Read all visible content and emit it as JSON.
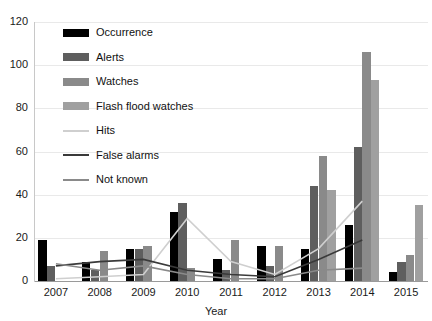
{
  "chart_data": {
    "type": "bar",
    "title": "",
    "xlabel": "Year",
    "ylabel": "",
    "categories": [
      "2007",
      "2008",
      "2009",
      "2010",
      "2011",
      "2012",
      "2013",
      "2014",
      "2015"
    ],
    "ylim": [
      0,
      120
    ],
    "ytick_values": [
      0,
      20,
      40,
      60,
      80,
      100,
      120
    ],
    "ytick_labels": [
      "0",
      "20",
      "40",
      "60",
      "80",
      "100",
      "120"
    ],
    "grid": true,
    "legend_position": "upper-left-inside",
    "series": [
      {
        "name": "Occurrence",
        "kind": "bar",
        "color": "#000000",
        "values": [
          19,
          9,
          15,
          32,
          10,
          16,
          15,
          26,
          4
        ]
      },
      {
        "name": "Alerts",
        "kind": "bar",
        "color": "#5e5e5e",
        "values": [
          7,
          5,
          15,
          36,
          5,
          7,
          44,
          62,
          9
        ]
      },
      {
        "name": "Watches",
        "kind": "bar",
        "color": "#8a8a8a",
        "values": [
          0,
          14,
          16,
          6,
          19,
          16,
          58,
          106,
          12
        ]
      },
      {
        "name": "Flash flood watches",
        "kind": "bar",
        "color": "#a0a0a0",
        "values": [
          0,
          0,
          0,
          0,
          0,
          0,
          42,
          93,
          35
        ]
      },
      {
        "name": "Hits",
        "kind": "line",
        "color": "#cfcfcf",
        "values": [
          1,
          2,
          3,
          29,
          9,
          3,
          15,
          37,
          null
        ]
      },
      {
        "name": "False alarms",
        "kind": "line",
        "color": "#3a3a3a",
        "values": [
          7,
          9,
          10,
          5,
          3,
          2,
          10,
          19,
          null
        ]
      },
      {
        "name": "Not known",
        "kind": "line",
        "color": "#8a8a8a",
        "values": [
          8,
          5,
          7,
          3,
          1,
          1,
          5,
          6,
          null
        ]
      }
    ]
  },
  "legend": {
    "items": [
      {
        "label": "Occurrence",
        "color": "#000000",
        "kind": "bar"
      },
      {
        "label": "Alerts",
        "color": "#5e5e5e",
        "kind": "bar"
      },
      {
        "label": "Watches",
        "color": "#8a8a8a",
        "kind": "bar"
      },
      {
        "label": "Flash flood watches",
        "color": "#a0a0a0",
        "kind": "bar"
      },
      {
        "label": "Hits",
        "color": "#cfcfcf",
        "kind": "line"
      },
      {
        "label": "False alarms",
        "color": "#3a3a3a",
        "kind": "line"
      },
      {
        "label": "Not known",
        "color": "#8a8a8a",
        "kind": "line"
      }
    ]
  },
  "axes": {
    "x_title": "Year"
  }
}
